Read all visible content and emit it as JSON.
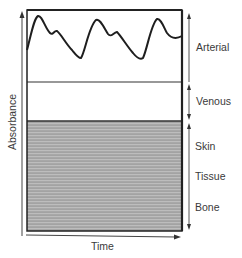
{
  "diagram": {
    "x_axis_label": "Time",
    "y_axis_label": "Absorbance",
    "regions": [
      {
        "label": "Arterial",
        "type": "pulsatile"
      },
      {
        "label": "Venous",
        "type": "constant"
      },
      {
        "labels": [
          "Skin",
          "Tissue",
          "Bone"
        ],
        "type": "constant-shaded"
      }
    ],
    "region_labels": {
      "arterial": "Arterial",
      "venous": "Venous",
      "skin": "Skin",
      "tissue": "Tissue",
      "bone": "Bone"
    },
    "colors": {
      "line": "#222222",
      "shaded": "#9a9a9a",
      "shaded_stripe": "#b8b8b8",
      "text": "#3a3a3a"
    }
  }
}
